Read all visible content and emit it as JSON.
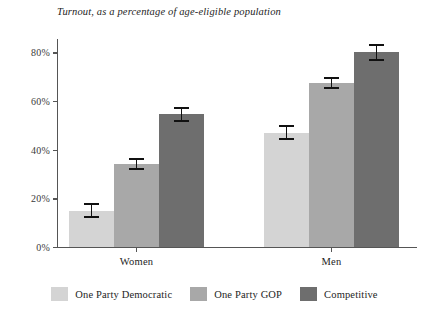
{
  "chart_data": {
    "type": "bar",
    "title": "Turnout, as a percentage of age-eligible population",
    "xlabel": "",
    "ylabel": "",
    "categories": [
      "Women",
      "Men"
    ],
    "ylim": [
      0,
      90
    ],
    "yticks": [
      0,
      20,
      40,
      60,
      80
    ],
    "ytick_labels": [
      "0%",
      "20%",
      "40%",
      "60%",
      "80%"
    ],
    "grid": false,
    "legend_position": "bottom",
    "series": [
      {
        "name": "One Party Democratic",
        "color": "#d4d4d4",
        "values": [
          15,
          47
        ],
        "errors": [
          3.0,
          3.0
        ]
      },
      {
        "name": "One Party GOP",
        "color": "#a8a8a8",
        "values": [
          34,
          67.5
        ],
        "errors": [
          2.5,
          2.5
        ]
      },
      {
        "name": "Competitive",
        "color": "#6e6e6e",
        "values": [
          54.5,
          80
        ],
        "errors": [
          3.0,
          3.5
        ]
      }
    ]
  },
  "legend": {
    "items": [
      {
        "label": "One Party Democratic",
        "color": "#d4d4d4"
      },
      {
        "label": "One Party GOP",
        "color": "#a8a8a8"
      },
      {
        "label": "Competitive",
        "color": "#6e6e6e"
      }
    ]
  },
  "axis": {
    "y_tick_labels": [
      "80%",
      "60%",
      "40%",
      "20%",
      "0%"
    ],
    "x_group_labels": [
      "Women",
      "Men"
    ]
  },
  "colors": {
    "one_party_democratic": "#d4d4d4",
    "one_party_gop": "#a8a8a8",
    "competitive": "#6e6e6e",
    "axis": "#555555",
    "error_bar": "#111111",
    "text": "#242424"
  },
  "caption_sliver": ""
}
